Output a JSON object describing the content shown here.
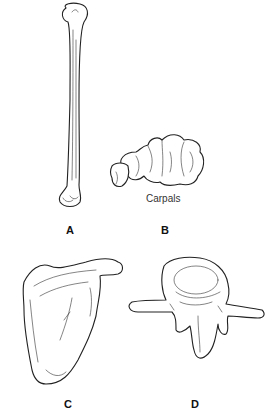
{
  "figure": {
    "panels": [
      {
        "id": "A",
        "label": "A",
        "subject": "humerus"
      },
      {
        "id": "B",
        "label": "B",
        "subject": "carpals",
        "caption": "Carpals"
      },
      {
        "id": "C",
        "label": "C",
        "subject": "scapula"
      },
      {
        "id": "D",
        "label": "D",
        "subject": "vertebra"
      }
    ]
  }
}
